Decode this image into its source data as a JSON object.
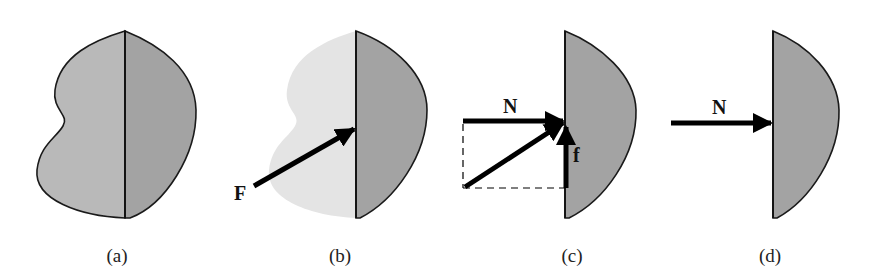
{
  "figure": {
    "panels": [
      {
        "id": "a",
        "caption": "(a)",
        "description": "Whole object split by vertical contact plane; left half light gray, right half darker gray"
      },
      {
        "id": "b",
        "caption": "(b)",
        "description": "Left part faded; force F acts on right half at contact plane",
        "force_label": "F"
      },
      {
        "id": "c",
        "caption": "(c)",
        "description": "Force decomposed into normal N and friction f components with dashed parallelogram",
        "normal_label": "N",
        "friction_label": "f"
      },
      {
        "id": "d",
        "caption": "(d)",
        "description": "Only normal force N acting on right half",
        "normal_label": "N"
      }
    ],
    "colors": {
      "left_half": "#b9b9b9",
      "right_half": "#a3a3a3",
      "faded": "#e4e4e4",
      "outline": "#1a1a1a",
      "arrow": "#000000"
    }
  }
}
